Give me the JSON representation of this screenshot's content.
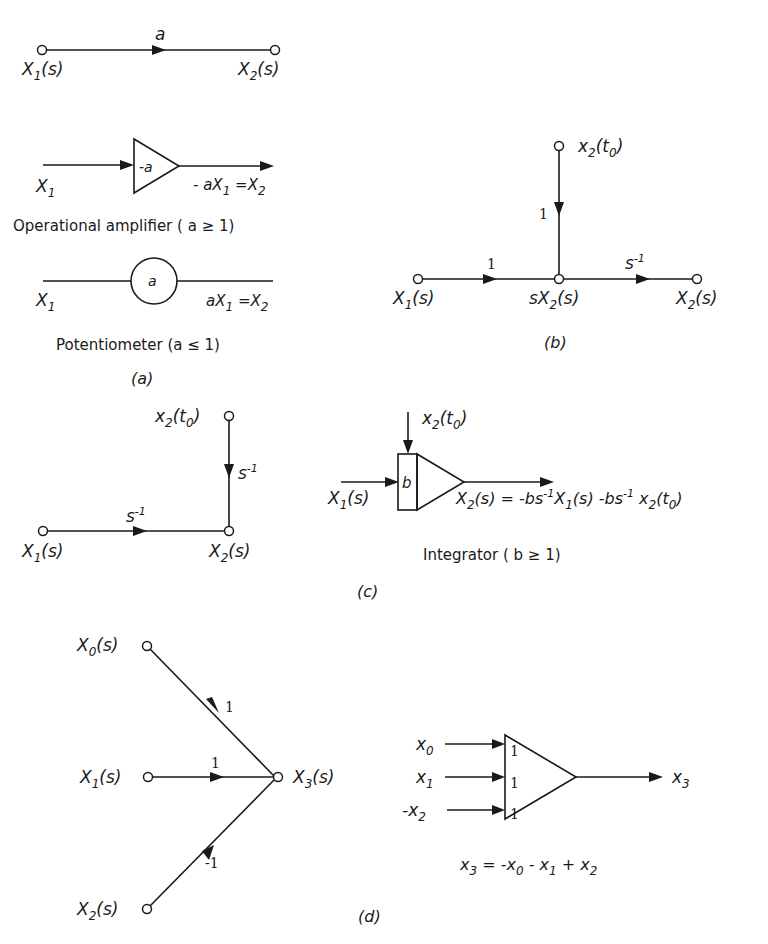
{
  "figure": {
    "panel_a": {
      "caption": "(a)",
      "branch": {
        "gain": "a",
        "from_label": "X",
        "from_sub": "1",
        "from_arg": "(s)",
        "to_label": "X",
        "to_sub": "2",
        "to_arg": "(s)"
      },
      "amplifier": {
        "inner": "-a",
        "in_label": "X",
        "in_sub": "1",
        "out_expr_pre": "- aX",
        "out_expr_sub1": "1",
        "out_expr_mid": " =X",
        "out_expr_sub2": "2",
        "description": "Operational amplifier ( a ≥ 1)"
      },
      "potentiometer": {
        "inner": "a",
        "in_label": "X",
        "in_sub": "1",
        "out_expr_pre": "aX",
        "out_expr_sub1": "1",
        "out_expr_mid": " =X",
        "out_expr_sub2": "2",
        "description": "Potentiometer   (a ≤ 1)"
      }
    },
    "panel_b": {
      "caption": "(b)",
      "initial_node": {
        "label": "x",
        "sub": "2",
        "arg_open": "(t",
        "arg_sub": "0",
        "arg_close": ")"
      },
      "vertical_gain": "1",
      "input_gain": "1",
      "output_gain_base": "s",
      "output_gain_exp": "-1",
      "input_node": {
        "label": "X",
        "sub": "1",
        "arg": "(s)"
      },
      "middle_node": {
        "label": "sX",
        "sub": "2",
        "arg": "(s)"
      },
      "output_node": {
        "label": "X",
        "sub": "2",
        "arg": "(s)"
      }
    },
    "panel_c": {
      "caption": "(c)",
      "flow_graph": {
        "initial_node": {
          "label": "x",
          "sub": "2",
          "arg_open": "(t",
          "arg_sub": "0",
          "arg_close": ")"
        },
        "vertical_gain_base": "s",
        "vertical_gain_exp": "-1",
        "horizontal_gain_base": "s",
        "horizontal_gain_exp": "-1",
        "input_node": {
          "label": "X",
          "sub": "1",
          "arg": "(s)"
        },
        "output_node": {
          "label": "X",
          "sub": "2",
          "arg": "(s)"
        }
      },
      "integrator": {
        "inner": "b",
        "initial_label": {
          "label": "x",
          "sub": "2",
          "arg_open": "(t",
          "arg_sub": "0",
          "arg_close": ")"
        },
        "in_label": {
          "label": "X",
          "sub": "1",
          "arg": "(s)"
        },
        "equation": "X2(s) = -bs^-1 X1(s) - bs^-1 x2(t0)",
        "description": "Integrator  ( b ≥ 1)"
      }
    },
    "panel_d": {
      "caption": "(d)",
      "flow_graph": {
        "nodes": [
          {
            "label": "X",
            "sub": "0",
            "arg": "(s)"
          },
          {
            "label": "X",
            "sub": "1",
            "arg": "(s)"
          },
          {
            "label": "X",
            "sub": "2",
            "arg": "(s)"
          },
          {
            "label": "X",
            "sub": "3",
            "arg": "(s)"
          }
        ],
        "gains": [
          "1",
          "1",
          "-1"
        ]
      },
      "summer": {
        "inputs": [
          {
            "prefix": "",
            "label": "x",
            "sub": "0",
            "weight": "1"
          },
          {
            "prefix": "",
            "label": "x",
            "sub": "1",
            "weight": "1"
          },
          {
            "prefix": "-",
            "label": "x",
            "sub": "2",
            "weight": "1"
          }
        ],
        "output": {
          "label": "x",
          "sub": "3"
        },
        "equation": "x3 = -x0 - x1 + x2"
      }
    }
  }
}
